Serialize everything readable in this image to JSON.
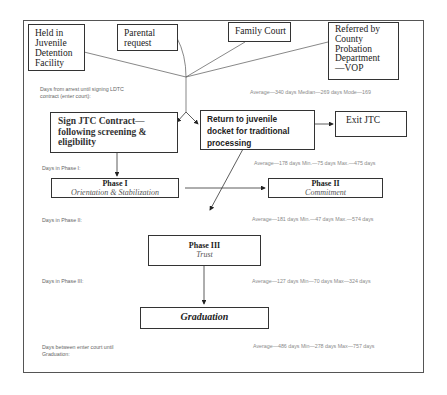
{
  "diagram": {
    "entry_sources": [
      {
        "id": "detention",
        "label": "Held in Juvenile Detention Facility",
        "lines": [
          "Held in",
          "Juvenile",
          "Detention",
          "Facility"
        ]
      },
      {
        "id": "parental",
        "label": "Parental request",
        "lines": [
          "Parental",
          "request"
        ]
      },
      {
        "id": "family_court",
        "label": "Family Court"
      },
      {
        "id": "probation",
        "label": "Referred by County Probation Department—VOP",
        "lines": [
          "Referred by",
          "County",
          "Probation",
          "Department",
          "—VOP"
        ]
      }
    ],
    "stages": {
      "sign_contract": {
        "lines": [
          "Sign JTC Contract—",
          "following screening &",
          "eligibility"
        ]
      },
      "return_docket": {
        "lines": [
          "Return to juvenile",
          "docket for traditional",
          "processing"
        ]
      },
      "exit": {
        "label": "Exit JTC"
      },
      "phase1": {
        "title": "Phase I",
        "subtitle": "Orientation & Stabilization"
      },
      "phase2": {
        "title": "Phase II",
        "subtitle": "Commitment"
      },
      "phase3": {
        "title": "Phase III",
        "subtitle": "Trust"
      },
      "graduation": {
        "label": "Graduation"
      }
    },
    "stats": [
      {
        "label_lines": [
          "Days from arrest until signing LDTC",
          " contract (enter court):"
        ],
        "values": "Average—340 days   Median—269 days   Mode—169"
      },
      {
        "label_lines": [
          "Days in Phase I:"
        ],
        "values": "Average—178 days   Min.—75 days   Max.—475 days"
      },
      {
        "label_lines": [
          "Days in Phase II:"
        ],
        "values": "Average—181 days   Min.—47 days   Max.—574 days"
      },
      {
        "label_lines": [
          "Days in Phase III:"
        ],
        "values": "Average—127 days   Min—70 days   Max—324 days"
      },
      {
        "label_lines": [
          "Days between enter court until",
          "Graduation:"
        ],
        "values": "Average—486 days  Min—278 days   Max—757 days"
      }
    ]
  }
}
